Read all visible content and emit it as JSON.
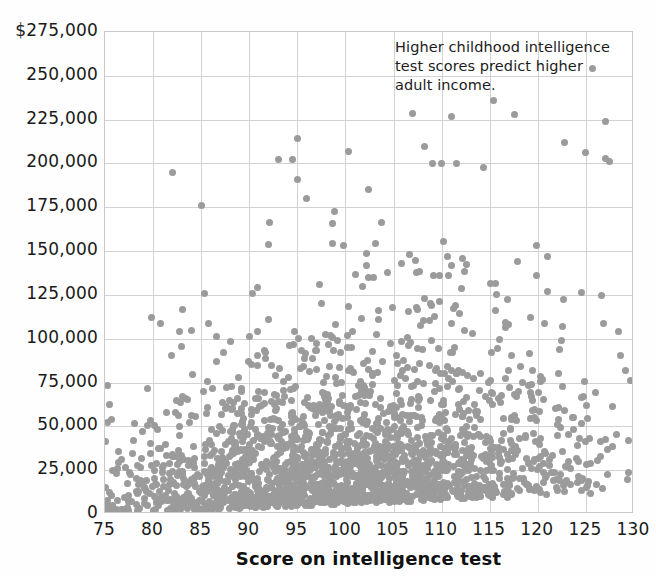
{
  "chart_data": {
    "type": "scatter",
    "title": "",
    "annotation": "Higher childhood intelligence\ntest scores predict higher\nadult income.",
    "xlabel": "Score on intelligence test",
    "ylabel": "",
    "xlim": [
      75,
      130
    ],
    "ylim": [
      0,
      275000
    ],
    "xticks": [
      75,
      80,
      85,
      90,
      95,
      100,
      105,
      110,
      115,
      120,
      125,
      130
    ],
    "xtick_labels": [
      "75",
      "80",
      "85",
      "90",
      "95",
      "100",
      "105",
      "110",
      "115",
      "120",
      "125",
      "130"
    ],
    "yticks": [
      0,
      25000,
      50000,
      75000,
      100000,
      125000,
      150000,
      175000,
      200000,
      225000,
      250000,
      275000
    ],
    "ytick_labels": [
      "0",
      "25,000",
      "50,000",
      "75,000",
      "100,000",
      "125,000",
      "150,000",
      "175,000",
      "200,000",
      "225,000",
      "250,000",
      "$275,000"
    ],
    "grid": true,
    "grid_x_every": 5,
    "grid_y_every": 25000,
    "legend": null,
    "marker": {
      "shape": "circle",
      "color": "#9b9b9b",
      "size_px": 7
    },
    "n_points": 2200,
    "notable_points": [
      {
        "x": 111,
        "y": 227000
      },
      {
        "x": 109,
        "y": 200000
      },
      {
        "x": 110,
        "y": 200000
      },
      {
        "x": 111.5,
        "y": 200000
      },
      {
        "x": 127,
        "y": 224000
      },
      {
        "x": 82,
        "y": 195000
      },
      {
        "x": 95,
        "y": 214000
      },
      {
        "x": 95,
        "y": 191000
      },
      {
        "x": 96,
        "y": 180000
      },
      {
        "x": 85,
        "y": 176000
      },
      {
        "x": 125,
        "y": 206000
      },
      {
        "x": 127,
        "y": 203000
      },
      {
        "x": 127.5,
        "y": 201000
      },
      {
        "x": 93,
        "y": 202000
      },
      {
        "x": 94.5,
        "y": 202000
      }
    ],
    "seed": 20240517,
    "generator": {
      "base_density_exp_scale": 30000,
      "score_income_slope": 900,
      "score_mean": 100,
      "ceiling": 275000
    }
  },
  "axes": {
    "y_axis_name": "income-axis",
    "x_axis_name": "score-axis"
  }
}
